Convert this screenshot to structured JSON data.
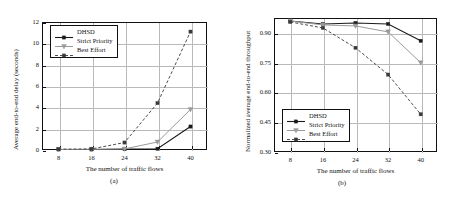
{
  "figure": {
    "panels": [
      {
        "caption": "(a)",
        "legend_position": "top-left"
      },
      {
        "caption": "(b)",
        "legend_position": "bottom-left"
      }
    ]
  },
  "chart_data": [
    {
      "type": "line",
      "title": "",
      "subtitle": "(a)",
      "xlabel": "The number of traffic flows",
      "ylabel": "Average end-to-end delay (seconds)",
      "categories": [
        "8",
        "16",
        "24",
        "32",
        "40"
      ],
      "x": [
        8,
        16,
        24,
        32,
        40
      ],
      "xlim": [
        4,
        44
      ],
      "ylim": [
        0,
        12
      ],
      "yticks": [
        "0",
        "2",
        "4",
        "6",
        "8",
        "10",
        "12"
      ],
      "ytickvalues": [
        0,
        2,
        4,
        6,
        8,
        10,
        12
      ],
      "xticks": [
        "8",
        "16",
        "24",
        "32",
        "40"
      ],
      "grid": true,
      "legend_position": "upper left",
      "series": [
        {
          "name": "DHSD",
          "values": [
            0.05,
            0.05,
            0.08,
            0.12,
            2.2
          ],
          "color": "#1a1a1a",
          "marker": "square",
          "dash": "solid",
          "width": 1.1
        },
        {
          "name": "Strict Priority",
          "values": [
            0.05,
            0.07,
            0.1,
            0.75,
            3.8
          ],
          "color": "#9a9a9a",
          "marker": "triangle-down",
          "dash": "solid",
          "width": 1.0
        },
        {
          "name": "Best Effort",
          "values": [
            0.08,
            0.1,
            0.7,
            4.4,
            11.1
          ],
          "color": "#3a3a3a",
          "marker": "square",
          "dash": "dashed",
          "width": 0.9
        }
      ]
    },
    {
      "type": "line",
      "title": "",
      "subtitle": "(b)",
      "xlabel": "The number of traffic flows",
      "ylabel": "Normalized average end-to-end throughput",
      "categories": [
        "8",
        "16",
        "24",
        "32",
        "40"
      ],
      "x": [
        8,
        16,
        24,
        32,
        40
      ],
      "xlim": [
        4,
        44
      ],
      "ylim": [
        0.3,
        0.975
      ],
      "yticks": [
        "0.30",
        "0.45",
        "0.60",
        "0.75",
        "0.90"
      ],
      "ytickvalues": [
        0.3,
        0.45,
        0.6,
        0.75,
        0.9
      ],
      "xticks": [
        "8",
        "16",
        "24",
        "32",
        "40"
      ],
      "grid": true,
      "legend_position": "lower left",
      "series": [
        {
          "name": "DHSD",
          "values": [
            0.96,
            0.945,
            0.95,
            0.945,
            0.86
          ],
          "color": "#1a1a1a",
          "marker": "square",
          "dash": "solid",
          "width": 1.1
        },
        {
          "name": "Strict Priority",
          "values": [
            0.96,
            0.94,
            0.935,
            0.905,
            0.75
          ],
          "color": "#9a9a9a",
          "marker": "triangle-down",
          "dash": "solid",
          "width": 1.0
        },
        {
          "name": "Best Effort",
          "values": [
            0.955,
            0.925,
            0.825,
            0.69,
            0.49
          ],
          "color": "#3a3a3a",
          "marker": "square",
          "dash": "dashed",
          "width": 0.9
        }
      ]
    }
  ]
}
